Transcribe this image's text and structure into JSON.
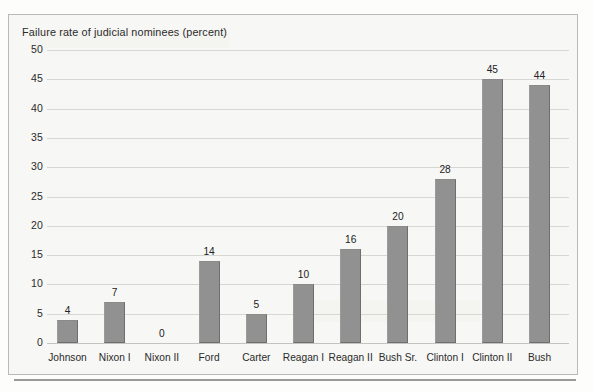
{
  "chart_data": {
    "type": "bar",
    "title": "Failure rate of judicial nominees (percent)",
    "xlabel": "",
    "ylabel": "",
    "ylim": [
      0,
      50
    ],
    "yticks": [
      0,
      5,
      10,
      15,
      20,
      25,
      30,
      35,
      40,
      45,
      50
    ],
    "ytick_labels": [
      "0",
      "5",
      "10",
      "15",
      "20",
      "25",
      "30",
      "35",
      "40",
      "45",
      "50"
    ],
    "grid": true,
    "legend": "none",
    "bar_color": "#919191",
    "bar_edge_color": "#6e6e6e",
    "background_color": "#f7f7f5",
    "gridline_color": "#d6d6d2",
    "categories": [
      "Johnson",
      "Nixon I",
      "Nixon II",
      "Ford",
      "Carter",
      "Reagan I",
      "Reagan II",
      "Bush Sr.",
      "Clinton I",
      "Clinton II",
      "Bush"
    ],
    "values": [
      4,
      7,
      0,
      14,
      5,
      10,
      16,
      20,
      28,
      45,
      44
    ],
    "data_labels": [
      "4",
      "7",
      "0",
      "14",
      "5",
      "10",
      "16",
      "20",
      "28",
      "45",
      "44"
    ]
  }
}
